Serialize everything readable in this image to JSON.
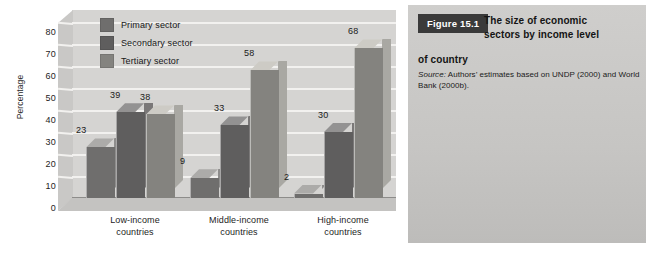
{
  "chart_data": {
    "type": "bar",
    "title": "",
    "xlabel": "",
    "ylabel": "Percentage",
    "ylim": [
      0,
      80
    ],
    "ytick_step": 10,
    "yticks": [
      80,
      70,
      60,
      50,
      40,
      30,
      20,
      10,
      0
    ],
    "grid": true,
    "legend_position": "top-left inside plot",
    "style": "3d clustered column",
    "categories": [
      "Low-income countries",
      "Middle-income countries",
      "High-income countries"
    ],
    "category_lines": [
      [
        "Low-income",
        "countries"
      ],
      [
        "Middle-income",
        "countries"
      ],
      [
        "High-income",
        "countries"
      ]
    ],
    "series": [
      {
        "name": "Primary sector",
        "color": "#6f6e6d",
        "values": [
          23,
          9,
          2
        ]
      },
      {
        "name": "Secondary sector",
        "color": "#5f5e5e",
        "values": [
          39,
          33,
          30
        ]
      },
      {
        "name": "Tertiary sector",
        "color": "#84837f",
        "values": [
          38,
          58,
          68
        ]
      }
    ]
  },
  "caption": {
    "figure_badge": "Figure 15.1",
    "title_line1": "The size of economic",
    "title_line2": "sectors by income level",
    "title_line3": "of country",
    "source_prefix": "Source:",
    "source_text": " Authors’ estimates based on UNDP (2000) and World Bank (2000b)."
  },
  "colors": {
    "page_background": "#ffffff",
    "plot_back_wall": "#d5d4d2",
    "plot_side_wall": "#c9c8c6",
    "plot_floor": "#c4c3c1",
    "gridline": "#f2f1ef",
    "caption_panel": "#c8c7c5",
    "badge_background": "#3a3a3a",
    "badge_text": "#ffffff",
    "text": "#1a1a1a"
  }
}
